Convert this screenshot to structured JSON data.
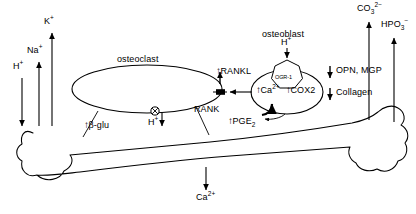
{
  "figure": {
    "type": "biological-pathway-diagram",
    "background_color": "#ffffff",
    "stroke_color": "#000000"
  },
  "cells": {
    "osteoclast": {
      "label": "osteoclast",
      "shape": "ellipse"
    },
    "osteoblast": {
      "label": "osteoblast",
      "shape": "ellipse"
    }
  },
  "receptors": {
    "ogr1": {
      "label": "OGR-1",
      "shape": "heptagon",
      "on_cell": "osteoblast"
    },
    "rank": {
      "label": "RANK",
      "shape": "membrane-bar",
      "on_cell": "osteoclast"
    },
    "proton_pump": {
      "label": "H",
      "charge": "+",
      "shape": "circle-with-cross",
      "on_cell": "osteoclast"
    }
  },
  "ions": {
    "hydrogen_in": {
      "name": "H",
      "charge": "+",
      "direction": "down"
    },
    "sodium": {
      "name": "Na",
      "charge": "+",
      "direction": "up"
    },
    "potassium": {
      "name": "K",
      "charge": "+",
      "direction": "up"
    },
    "carbonate": {
      "name": "CO",
      "subscript": "3",
      "charge": "2−",
      "direction": "up"
    },
    "phosphate": {
      "name": "HPO",
      "subscript": "3",
      "charge": "−",
      "direction": "up"
    },
    "calcium_release": {
      "name": "Ca",
      "charge": "2+",
      "direction": "down"
    }
  },
  "labels": {
    "osteoclast": "osteoclast",
    "osteoblast": "osteoblast",
    "h_in_osteoblast": "H",
    "h_in_osteoblast_charge": "+",
    "ogr1": "OGR-1",
    "rank": "RANK",
    "rankl": "RANKL",
    "rankl_arrow": "↑",
    "beta_glu": "β-glu",
    "beta_glu_arrow": "↑",
    "h_pump": "H",
    "h_pump_charge": "+",
    "ca_intracellular": "Ca",
    "ca_intracellular_charge": "2+",
    "ca_arrow": "↑",
    "cox2": "COX2",
    "cox2_arrow": "↑",
    "pge2": "PGE",
    "pge2_sub": "2",
    "pge2_arrow": "↑",
    "opn_mgp": "OPN, MGP",
    "opn_mgp_arrow": "↓",
    "collagen": "Collagen",
    "collagen_arrow": "↓",
    "na": "Na",
    "na_charge": "+",
    "k": "K",
    "k_charge": "+",
    "h_left": "H",
    "h_left_charge": "+",
    "co3": "CO",
    "co3_sub": "3",
    "co3_charge": "2−",
    "hpo3": "HPO",
    "hpo3_sub": "3",
    "hpo3_charge": "−",
    "ca_bottom": "Ca",
    "ca_bottom_charge": "2+"
  }
}
